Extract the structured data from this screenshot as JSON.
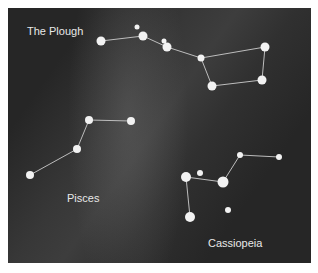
{
  "diagram": {
    "background_color": "#262626",
    "star_color": "#f2f2f2",
    "line_color": "#bdbdbd",
    "constellations": [
      {
        "name": "The Plough",
        "label_pos": [
          27,
          26
        ],
        "stars": [
          {
            "x": 101,
            "y": 41,
            "r": 4.5
          },
          {
            "x": 137,
            "y": 27,
            "r": 2.5
          },
          {
            "x": 143,
            "y": 36,
            "r": 4.5
          },
          {
            "x": 164,
            "y": 41,
            "r": 2.5
          },
          {
            "x": 167,
            "y": 47,
            "r": 4.5
          },
          {
            "x": 201,
            "y": 58,
            "r": 3.5
          },
          {
            "x": 265,
            "y": 47,
            "r": 4.5
          },
          {
            "x": 212,
            "y": 86,
            "r": 4.5
          },
          {
            "x": 262,
            "y": 80,
            "r": 4.5
          }
        ],
        "lines": [
          [
            0,
            2
          ],
          [
            2,
            4
          ],
          [
            4,
            5
          ],
          [
            5,
            6
          ],
          [
            6,
            8
          ],
          [
            8,
            7
          ],
          [
            7,
            5
          ]
        ]
      },
      {
        "name": "Pisces",
        "label_pos": [
          67,
          193
        ],
        "stars": [
          {
            "x": 89,
            "y": 120,
            "r": 4
          },
          {
            "x": 131,
            "y": 121,
            "r": 4
          },
          {
            "x": 77,
            "y": 149,
            "r": 4
          },
          {
            "x": 30,
            "y": 175,
            "r": 4
          }
        ],
        "lines": [
          [
            1,
            0
          ],
          [
            0,
            2
          ],
          [
            2,
            3
          ]
        ]
      },
      {
        "name": "Cassiopeia",
        "label_pos": [
          208,
          238
        ],
        "stars": [
          {
            "x": 240,
            "y": 155,
            "r": 3
          },
          {
            "x": 279,
            "y": 157,
            "r": 3
          },
          {
            "x": 186,
            "y": 177,
            "r": 5
          },
          {
            "x": 200,
            "y": 173,
            "r": 3
          },
          {
            "x": 223,
            "y": 182,
            "r": 5.5
          },
          {
            "x": 190,
            "y": 217,
            "r": 5
          },
          {
            "x": 228,
            "y": 210,
            "r": 3
          }
        ],
        "lines": [
          [
            1,
            0
          ],
          [
            0,
            4
          ],
          [
            4,
            2
          ],
          [
            2,
            5
          ]
        ]
      }
    ]
  },
  "labels": {
    "plough": "The Plough",
    "pisces": "Pisces",
    "cassiopeia": "Cassiopeia"
  }
}
